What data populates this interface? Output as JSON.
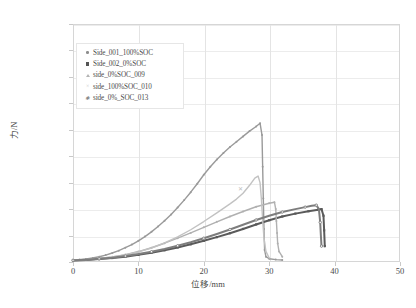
{
  "chart_data": {
    "type": "line",
    "title": "",
    "xlabel": "位移/mm",
    "ylabel": "力/N",
    "xlim": [
      0,
      50
    ],
    "ylim": [
      0,
      180000
    ],
    "xticks": [
      "0",
      "10",
      "20",
      "30",
      "40",
      "50"
    ],
    "yticks": [
      "0",
      "20000",
      "40000",
      "60000",
      "80000",
      "100000",
      "120000",
      "140000",
      "160000",
      "180000"
    ],
    "grid": true,
    "legend_position": "upper-left-inside",
    "series": [
      {
        "name": "Side_001_100%SOC",
        "marker": "dot",
        "color": "#9a9a9a",
        "points": [
          [
            0,
            1500
          ],
          [
            1,
            1800
          ],
          [
            2,
            2300
          ],
          [
            3,
            3000
          ],
          [
            4,
            4000
          ],
          [
            5,
            5200
          ],
          [
            6,
            6800
          ],
          [
            7,
            8600
          ],
          [
            8,
            10800
          ],
          [
            9,
            13200
          ],
          [
            10,
            16000
          ],
          [
            11,
            19200
          ],
          [
            12,
            22800
          ],
          [
            13,
            26800
          ],
          [
            14,
            31200
          ],
          [
            15,
            36000
          ],
          [
            16,
            41200
          ],
          [
            17,
            46800
          ],
          [
            18,
            52800
          ],
          [
            19,
            59200
          ],
          [
            20,
            66000
          ],
          [
            21,
            72000
          ],
          [
            22,
            77500
          ],
          [
            23,
            82500
          ],
          [
            24,
            87000
          ],
          [
            25,
            91000
          ],
          [
            26,
            95000
          ],
          [
            27,
            99000
          ],
          [
            28,
            102500
          ],
          [
            28.6,
            105000
          ],
          [
            28.9,
            96000
          ],
          [
            29.0,
            72000
          ],
          [
            29.1,
            48000
          ],
          [
            29.2,
            25000
          ],
          [
            29.3,
            9000
          ],
          [
            29.5,
            4000
          ],
          [
            30,
            2500
          ],
          [
            31,
            1800
          ],
          [
            32,
            1500
          ]
        ]
      },
      {
        "name": "Side_002_0%SOC",
        "marker": "square",
        "color": "#5a5a5a",
        "points": [
          [
            0,
            1200
          ],
          [
            2,
            1600
          ],
          [
            4,
            2200
          ],
          [
            6,
            3000
          ],
          [
            8,
            4000
          ],
          [
            10,
            5400
          ],
          [
            12,
            7000
          ],
          [
            14,
            8900
          ],
          [
            16,
            11000
          ],
          [
            18,
            13400
          ],
          [
            20,
            16000
          ],
          [
            22,
            18800
          ],
          [
            24,
            21800
          ],
          [
            26,
            25000
          ],
          [
            28,
            28400
          ],
          [
            30,
            31600
          ],
          [
            32,
            34400
          ],
          [
            34,
            36600
          ],
          [
            36,
            38400
          ],
          [
            37.5,
            39600
          ],
          [
            38,
            40000
          ],
          [
            38.3,
            35000
          ],
          [
            38.4,
            24000
          ],
          [
            38.5,
            12000
          ]
        ]
      },
      {
        "name": "side_0%SOC_009",
        "marker": "triangle",
        "color": "#b0b0b0",
        "points": [
          [
            0,
            1400
          ],
          [
            2,
            1900
          ],
          [
            4,
            2700
          ],
          [
            6,
            3900
          ],
          [
            8,
            5600
          ],
          [
            10,
            7900
          ],
          [
            12,
            10800
          ],
          [
            14,
            14200
          ],
          [
            16,
            18000
          ],
          [
            18,
            22000
          ],
          [
            20,
            26200
          ],
          [
            22,
            30400
          ],
          [
            24,
            34400
          ],
          [
            26,
            38200
          ],
          [
            28,
            41800
          ],
          [
            30,
            44400
          ],
          [
            30.8,
            45200
          ],
          [
            31.0,
            40000
          ],
          [
            31.1,
            31000
          ],
          [
            31.2,
            22000
          ],
          [
            31.3,
            14000
          ],
          [
            31.5,
            8000
          ],
          [
            32,
            4000
          ]
        ]
      },
      {
        "name": "side_100%SOC_010",
        "marker": "x",
        "color": "#c2c2c2",
        "points": [
          [
            0,
            1300
          ],
          [
            2,
            1800
          ],
          [
            4,
            2600
          ],
          [
            6,
            3800
          ],
          [
            8,
            5400
          ],
          [
            10,
            7600
          ],
          [
            12,
            10600
          ],
          [
            14,
            14400
          ],
          [
            16,
            19000
          ],
          [
            18,
            24400
          ],
          [
            20,
            30600
          ],
          [
            22,
            37200
          ],
          [
            24,
            44000
          ],
          [
            25,
            47600
          ],
          [
            26,
            52000
          ],
          [
            27,
            58000
          ],
          [
            27.8,
            63500
          ],
          [
            28.3,
            65000
          ],
          [
            28.6,
            60000
          ],
          [
            28.8,
            48000
          ],
          [
            29.0,
            32000
          ],
          [
            29.2,
            18000
          ],
          [
            29.5,
            8000
          ],
          [
            30,
            3000
          ]
        ]
      },
      {
        "name": "side_0%_SOC_013",
        "marker": "star",
        "color": "#7d7d7d",
        "points": [
          [
            0,
            1300
          ],
          [
            2,
            1750
          ],
          [
            4,
            2400
          ],
          [
            6,
            3300
          ],
          [
            8,
            4500
          ],
          [
            10,
            6000
          ],
          [
            12,
            7800
          ],
          [
            14,
            9900
          ],
          [
            16,
            12300
          ],
          [
            18,
            15000
          ],
          [
            20,
            18000
          ],
          [
            22,
            21200
          ],
          [
            24,
            24600
          ],
          [
            26,
            28200
          ],
          [
            28,
            31800
          ],
          [
            30,
            35000
          ],
          [
            32,
            37800
          ],
          [
            34,
            40000
          ],
          [
            35.5,
            41500
          ],
          [
            36.5,
            42500
          ],
          [
            37.2,
            43000
          ],
          [
            37.6,
            40000
          ],
          [
            37.8,
            30000
          ],
          [
            37.9,
            20000
          ],
          [
            38,
            12000
          ]
        ]
      }
    ]
  },
  "axes": {
    "y_label": "力/N",
    "x_label": "位移/mm",
    "y_ticks": [
      "180000",
      "160000",
      "140000",
      "120000",
      "100000",
      "80000",
      "60000",
      "40000",
      "20000",
      "0"
    ],
    "x_ticks": [
      "0",
      "10",
      "20",
      "30",
      "40",
      "50"
    ]
  },
  "legend": {
    "items": [
      {
        "label": "Side_001_100%SOC",
        "marker": "dot-marker",
        "color": "#8d8d8d"
      },
      {
        "label": "Side_002_0%SOC",
        "marker": "square-marker",
        "color": "#555555"
      },
      {
        "label": "side_0%SOC_009",
        "marker": "triangle-marker",
        "color": "#b4b4b4"
      },
      {
        "label": "side_100%SOC_010",
        "marker": "x-marker",
        "color": "#c8c8c8"
      },
      {
        "label": "side_0%_SOC_013",
        "marker": "star-marker",
        "color": "#8a8a8a"
      }
    ]
  },
  "title": ""
}
